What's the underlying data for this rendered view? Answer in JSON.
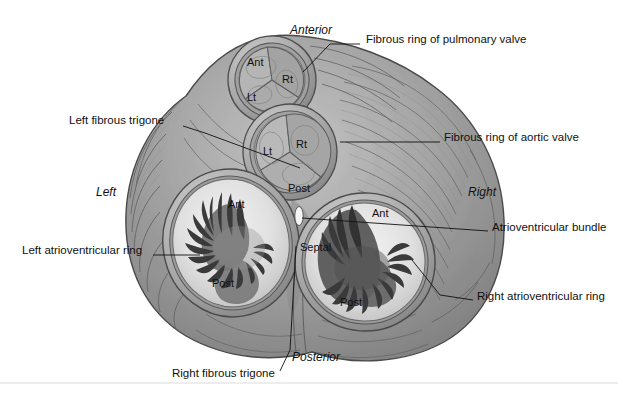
{
  "figure": {
    "background_color": "#ffffff",
    "tissue_color": "#9a9a9a",
    "tissue_dark": "#6e6e6e",
    "tissue_light": "#c9c9c9",
    "leaflet_color": "#3f3f3f",
    "line_color": "#111111"
  },
  "orientation": {
    "anterior": "Anterior",
    "posterior": "Posterior",
    "left": "Left",
    "right": "Right"
  },
  "callouts": [
    {
      "id": "fibrous-ring-pulmonary-valve",
      "label": "Fibrous ring of pulmonary valve",
      "text_x": 366,
      "text_y": 39,
      "anchor": "start",
      "line": [
        [
          360,
          44
        ],
        [
          330,
          44
        ],
        [
          303,
          72
        ]
      ]
    },
    {
      "id": "fibrous-ring-aortic-valve",
      "label": "Fibrous ring of aortic valve",
      "text_x": 444,
      "text_y": 137,
      "anchor": "start",
      "line": [
        [
          440,
          142
        ],
        [
          340,
          142
        ]
      ]
    },
    {
      "id": "left-fibrous-trigone",
      "label": "Left fibrous trigone",
      "text_x": 69,
      "text_y": 120,
      "anchor": "start",
      "line": [
        [
          183,
          126
        ],
        [
          205,
          133
        ],
        [
          300,
          168
        ]
      ]
    },
    {
      "id": "left-atrioventricular-ring",
      "label": "Left atrioventricular ring",
      "text_x": 22,
      "text_y": 250,
      "anchor": "start",
      "line": [
        [
          153,
          255
        ],
        [
          200,
          255
        ]
      ]
    },
    {
      "id": "atrioventricular-bundle",
      "label": "Atrioventricular bundle",
      "text_x": 492,
      "text_y": 227,
      "anchor": "start",
      "line": [
        [
          488,
          231
        ],
        [
          302,
          218
        ]
      ]
    },
    {
      "id": "right-atrioventricular-ring",
      "label": "Right atrioventricular ring",
      "text_x": 477,
      "text_y": 296,
      "anchor": "start",
      "line": [
        [
          473,
          300
        ],
        [
          440,
          295
        ],
        [
          412,
          260
        ]
      ]
    },
    {
      "id": "right-fibrous-trigone",
      "label": "Right fibrous trigone",
      "text_x": 172,
      "text_y": 373,
      "anchor": "start",
      "line": [
        [
          280,
          371
        ],
        [
          290,
          350
        ],
        [
          296,
          246
        ]
      ]
    }
  ],
  "valves": [
    {
      "id": "pulmonary-valve",
      "name": "Pulmonary valve",
      "cx": 272,
      "cy": 80,
      "rx": 42,
      "ry": 42,
      "rot": -8,
      "cusps": [
        {
          "label": "Ant",
          "x": 258,
          "y": 62
        },
        {
          "label": "Rt",
          "x": 290,
          "y": 79
        },
        {
          "label": "Lt",
          "x": 256,
          "y": 97
        }
      ]
    },
    {
      "id": "aortic-valve",
      "name": "Aortic valve",
      "cx": 290,
      "cy": 152,
      "rx": 45,
      "ry": 46,
      "rot": -6,
      "cusps": [
        {
          "label": "Lt",
          "x": 271,
          "y": 151
        },
        {
          "label": "Rt",
          "x": 304,
          "y": 144
        },
        {
          "label": "Post",
          "x": 301,
          "y": 188
        }
      ]
    },
    {
      "id": "left-atrioventricular-valve",
      "name": "Left atrioventricular (mitral) valve",
      "cx": 231,
      "cy": 243,
      "rx": 58,
      "ry": 64,
      "rot": -10,
      "cusps": [
        {
          "label": "Ant",
          "x": 238,
          "y": 204
        },
        {
          "label": "Post",
          "x": 226,
          "y": 283
        }
      ]
    },
    {
      "id": "right-atrioventricular-valve",
      "name": "Right atrioventricular (tricuspid) valve",
      "cx": 365,
      "cy": 262,
      "rx": 60,
      "ry": 59,
      "rot": 4,
      "cusps": [
        {
          "label": "Ant",
          "x": 383,
          "y": 213
        },
        {
          "label": "Septal",
          "x": 318,
          "y": 247
        },
        {
          "label": "Post",
          "x": 353,
          "y": 302
        }
      ]
    }
  ],
  "structures": {
    "av_bundle_marker": {
      "cx": 299,
      "cy": 216,
      "rx": 4,
      "ry": 9
    },
    "bottom_rule": {
      "x1": 0,
      "y1": 383,
      "x2": 618,
      "y2": 383,
      "color": "#ededed"
    }
  }
}
